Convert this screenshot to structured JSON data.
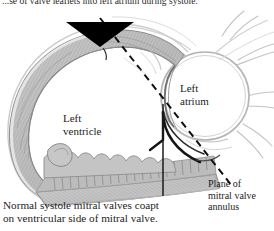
{
  "figure": {
    "type": "anatomical-diagram",
    "orientation": "sagittal-section-of-left-heart",
    "style": "grayscale-pen-and-wash-medical-illustration",
    "top_text_partial": "...se of valve leaflets into left atrium during systole.",
    "caption": "Normal systole mitral valves coapt\non ventricular side of mitral valve."
  },
  "labels": {
    "left_ventricle": "Left\nventricle",
    "left_atrium": "Left\natrium",
    "plane_of_annulus": "Plane of\nmitral valve\nannulus"
  },
  "annotations": {
    "arrowhead": "downward-black-triangle",
    "dashed_line": "plane-of-mitral-valve-annulus-dashed-line",
    "vertical_line": "leader-line-to-caption",
    "leaflet_curve": "coapting-mitral-leaflets"
  },
  "colors": {
    "background": "#ffffff",
    "ink": "#1d1d1d",
    "myocardium_fill": "#b8b8b8",
    "myocardium_light": "#d8d8d8",
    "outline_gray": "#8e8e8e",
    "outline_faint": "#bdbdbd",
    "endocardium": "#9c9c9c",
    "atrium_outline": "#6e6e6e"
  }
}
